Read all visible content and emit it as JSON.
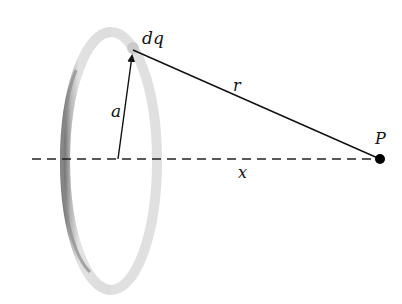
{
  "diagram": {
    "labels": {
      "charge_element": "dq",
      "radius": "a",
      "distance": "r",
      "axis_distance": "x",
      "point": "P"
    },
    "elements": {
      "ring": {
        "cx": 111,
        "cy": 161,
        "rx": 46,
        "ry": 129,
        "color_light": "#d8d8d8",
        "color_dark": "#8a8a8a"
      },
      "axis": {
        "x1": 32,
        "y1": 159,
        "x2": 380,
        "y2": 159,
        "style": "dashed"
      },
      "radius_arrow": {
        "from": [
          118,
          159
        ],
        "to": [
          133,
          50
        ]
      },
      "line_r": {
        "from": [
          133,
          50
        ],
        "to": [
          380,
          159
        ]
      },
      "point_P": {
        "cx": 380,
        "cy": 159,
        "r": 5
      }
    }
  }
}
